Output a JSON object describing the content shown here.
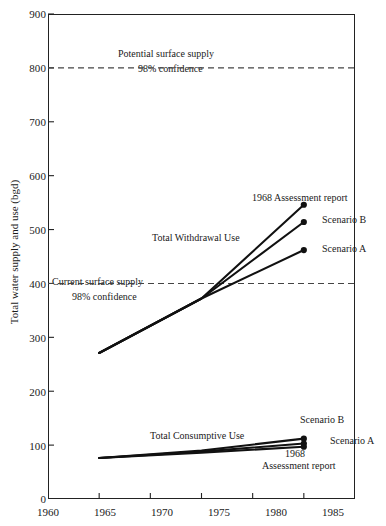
{
  "chart_data": {
    "type": "line",
    "title": "",
    "xlabel": "",
    "ylabel": "Total water supply and use (bgd)",
    "xlim": [
      1960,
      1990
    ],
    "ylim": [
      0,
      900
    ],
    "grid": false,
    "legend_position": "inline-annotations",
    "x_ticks": [
      1960,
      1965,
      1970,
      1975,
      1980,
      1985
    ],
    "y_ticks": [
      0,
      100,
      200,
      300,
      400,
      500,
      600,
      700,
      800,
      900
    ],
    "reference_lines": [
      {
        "name": "potential-surface-supply",
        "value": 800,
        "style": "dashed",
        "label": "Potential surface supply",
        "sublabel": "98% confidence"
      },
      {
        "name": "current-surface-supply",
        "value": 400,
        "style": "dashed",
        "label": "Current surface supply",
        "sublabel": "98% confidence"
      }
    ],
    "group_labels": [
      {
        "name": "total-withdrawal-use",
        "text": "Total Withdrawal Use"
      },
      {
        "name": "total-consumptive-use",
        "text": "Total Consumptive Use"
      }
    ],
    "series": [
      {
        "name": "withdrawal-1968-assessment-report",
        "group": "Total Withdrawal Use",
        "label": "1968 Assessment report",
        "x": [
          1965,
          1975,
          1985
        ],
        "values": [
          271,
          372,
          546
        ],
        "endpoint_marker": true
      },
      {
        "name": "withdrawal-scenario-b",
        "group": "Total Withdrawal Use",
        "label": "Scenario B",
        "x": [
          1965,
          1975,
          1985
        ],
        "values": [
          271,
          372,
          514
        ],
        "endpoint_marker": true
      },
      {
        "name": "withdrawal-scenario-a",
        "group": "Total Withdrawal Use",
        "label": "Scenario A",
        "x": [
          1965,
          1975,
          1985
        ],
        "values": [
          271,
          372,
          462
        ],
        "endpoint_marker": true
      },
      {
        "name": "consumptive-scenario-b",
        "group": "Total Consumptive Use",
        "label": "Scenario B",
        "x": [
          1965,
          1975,
          1985
        ],
        "values": [
          76,
          90,
          112
        ],
        "endpoint_marker": true
      },
      {
        "name": "consumptive-scenario-a",
        "group": "Total Consumptive Use",
        "label": "Scenario A",
        "x": [
          1965,
          1975,
          1985
        ],
        "values": [
          76,
          88,
          103
        ],
        "endpoint_marker": true
      },
      {
        "name": "consumptive-1968-assessment-report",
        "group": "Total Consumptive Use",
        "label": "1968 Assessment report",
        "x": [
          1965,
          1975,
          1985
        ],
        "values": [
          76,
          86,
          97
        ],
        "endpoint_marker": true
      }
    ]
  },
  "axis": {
    "y_label": "Total water supply and use (bgd)",
    "y_ticks": [
      "900",
      "800",
      "700",
      "600",
      "500",
      "400",
      "300",
      "200",
      "100",
      "0"
    ],
    "x_ticks": [
      "1960",
      "1965",
      "1970",
      "1975",
      "1980",
      "1985"
    ]
  },
  "annotations": {
    "potential_supply": "Potential surface supply",
    "potential_confidence": "98% confidence",
    "current_supply": "Current surface supply",
    "current_confidence": "98% confidence",
    "total_withdrawal_use": "Total Withdrawal Use",
    "total_consumptive_use": "Total Consumptive Use",
    "withdrawal_1968": "1968 Assessment report",
    "withdrawal_scenario_b": "Scenario B",
    "withdrawal_scenario_a": "Scenario A",
    "consumptive_scenario_b": "Scenario B",
    "consumptive_scenario_a": "Scenario A",
    "consumptive_1968_line1": "1968",
    "consumptive_1968_line2": "Assessment report"
  },
  "colors": {
    "line": "#111111",
    "axis": "#222222",
    "dashed": "#444444",
    "background": "#ffffff"
  }
}
